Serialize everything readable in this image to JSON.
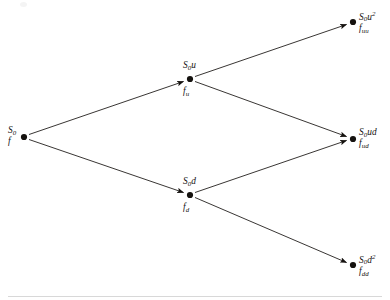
{
  "figure": {
    "type": "binomial-tree",
    "background_color": "#ffffff",
    "ink_color": "#15120f",
    "rule_color": "#d8d8d8"
  },
  "nodes": [
    {
      "id": "root",
      "x": 24,
      "y": 137,
      "asset_main": "S",
      "asset_sub": "0",
      "asset_sup": "",
      "option_main": "f",
      "option_sub": "",
      "asset_label": "S0",
      "option_label": "f",
      "label_position": "left"
    },
    {
      "id": "up",
      "x": 190,
      "y": 79,
      "asset_main": "S",
      "asset_sub": "0",
      "asset_sup": "u",
      "option_main": "f",
      "option_sub": "u",
      "asset_label": "S0u",
      "option_label": "fu",
      "label_position": "above-below"
    },
    {
      "id": "down",
      "x": 190,
      "y": 195,
      "asset_main": "S",
      "asset_sub": "0",
      "asset_sup": "d",
      "option_main": "f",
      "option_sub": "d",
      "asset_label": "S0d",
      "option_label": "fd",
      "label_position": "above-below"
    },
    {
      "id": "upup",
      "x": 353,
      "y": 22,
      "asset_main": "S",
      "asset_sub": "0",
      "asset_sup": "u2",
      "option_main": "f",
      "option_sub": "uu",
      "asset_label": "S0u2",
      "option_label": "fuu",
      "label_position": "right"
    },
    {
      "id": "updown",
      "x": 353,
      "y": 139,
      "asset_main": "S",
      "asset_sub": "0",
      "asset_sup": "ud",
      "option_main": "f",
      "option_sub": "ud",
      "asset_label": "S0ud",
      "option_label": "fud",
      "label_position": "right"
    },
    {
      "id": "downdown",
      "x": 353,
      "y": 265,
      "asset_main": "S",
      "asset_sub": "0",
      "asset_sup": "d2",
      "option_main": "f",
      "option_sub": "dd",
      "asset_label": "S0d2",
      "option_label": "fdd",
      "label_position": "right"
    }
  ],
  "edges": [
    {
      "id": "root-up",
      "from": "root",
      "to": "up",
      "direction": "up"
    },
    {
      "id": "root-down",
      "from": "root",
      "to": "down",
      "direction": "down"
    },
    {
      "id": "up-upup",
      "from": "up",
      "to": "upup",
      "direction": "up"
    },
    {
      "id": "up-updown",
      "from": "up",
      "to": "updown",
      "direction": "down"
    },
    {
      "id": "down-updown",
      "from": "down",
      "to": "updown",
      "direction": "up"
    },
    {
      "id": "down-downdown",
      "from": "down",
      "to": "downdown",
      "direction": "down"
    }
  ],
  "labels": {
    "root_asset": "S",
    "root_asset_sub": "0",
    "root_option": "f",
    "up_asset": "S",
    "up_asset_sub": "0",
    "up_asset_tail": "u",
    "up_option": "f",
    "up_option_sub": "u",
    "down_asset": "S",
    "down_asset_sub": "0",
    "down_asset_tail": "d",
    "down_option": "f",
    "down_option_sub": "d",
    "upup_asset": "S",
    "upup_asset_sub": "0",
    "upup_asset_tail": "u",
    "upup_asset_pow": "2",
    "upup_option": "f",
    "upup_option_sub": "uu",
    "updown_asset": "S",
    "updown_asset_sub": "0",
    "updown_asset_tail": "ud",
    "updown_option": "f",
    "updown_option_sub": "ud",
    "downdown_asset": "S",
    "downdown_asset_sub": "0",
    "downdown_asset_tail": "d",
    "downdown_asset_pow": "2",
    "downdown_option": "f",
    "downdown_option_sub": "dd"
  }
}
